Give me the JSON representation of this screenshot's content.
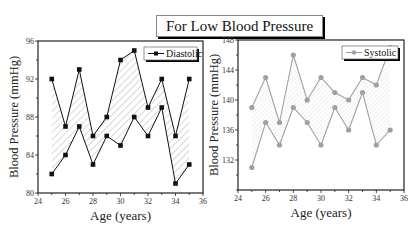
{
  "title": "For Low Blood Pressure",
  "chart_data": [
    {
      "type": "line",
      "panel": "left",
      "title": "",
      "legend": [
        "Diastolic"
      ],
      "legend_position": "upper right",
      "xlabel": "Age (years)",
      "ylabel": "Blood Pressure (mmHg)",
      "xlim": [
        24,
        36
      ],
      "ylim": [
        80,
        96
      ],
      "xticks": [
        24,
        26,
        28,
        30,
        32,
        34,
        36
      ],
      "yticks": [
        80,
        84,
        88,
        92,
        96
      ],
      "grid": false,
      "fill_between": "hatched",
      "color": "#111111",
      "marker": "square",
      "x": [
        25,
        26,
        27,
        28,
        29,
        30,
        31,
        32,
        33,
        34,
        35
      ],
      "series": [
        {
          "name": "Diastolic upper",
          "values": [
            92,
            87,
            93,
            86,
            88,
            94,
            95,
            89,
            92,
            86,
            92
          ]
        },
        {
          "name": "Diastolic lower",
          "values": [
            82,
            84,
            87,
            83,
            86,
            85,
            88,
            86,
            89,
            81,
            83
          ]
        }
      ]
    },
    {
      "type": "line",
      "panel": "right",
      "title": "",
      "legend": [
        "Systolic"
      ],
      "legend_position": "upper right",
      "xlabel": "Age (years)",
      "ylabel": "Blood Pressure (mmHg)",
      "xlim": [
        24,
        36
      ],
      "ylim": [
        128,
        148
      ],
      "xticks": [
        24,
        26,
        28,
        30,
        32,
        34,
        36
      ],
      "yticks": [
        132,
        136,
        140,
        144,
        148
      ],
      "grid": false,
      "fill_between": "light-hatched",
      "color": "#a0a0a0",
      "marker": "circle",
      "x": [
        25,
        26,
        27,
        28,
        29,
        30,
        31,
        32,
        33,
        34,
        35
      ],
      "series": [
        {
          "name": "Systolic upper",
          "values": [
            139,
            143,
            137,
            146,
            140,
            143,
            141,
            140,
            143,
            142,
            147
          ]
        },
        {
          "name": "Systolic lower",
          "values": [
            131,
            137,
            134,
            139,
            137,
            134,
            139,
            136,
            141,
            134,
            136
          ]
        }
      ]
    }
  ]
}
